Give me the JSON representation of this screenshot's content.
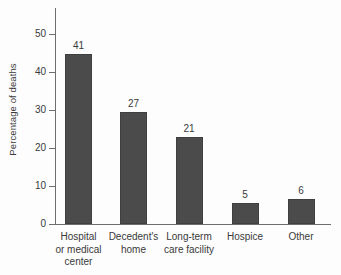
{
  "chart_data": {
    "type": "bar",
    "title": "",
    "xlabel": "",
    "ylabel": "Percentage of deaths",
    "categories": [
      "Hospital or medical center",
      "Decedent's home",
      "Long-term care facility",
      "Hospice",
      "Other"
    ],
    "category_lines": [
      [
        "Hospital",
        "or medical",
        "center"
      ],
      [
        "Decedent's",
        "home"
      ],
      [
        "Long-term",
        "care facility"
      ],
      [
        "Hospice"
      ],
      [
        "Other"
      ]
    ],
    "values": [
      41,
      27,
      21,
      5,
      6
    ],
    "value_labels": [
      "41",
      "27",
      "21",
      "5",
      "6"
    ],
    "ylim": [
      0,
      52
    ],
    "yticks": [
      0,
      10,
      20,
      30,
      40,
      50
    ],
    "ytick_labels": [
      "0",
      "10",
      "20",
      "30",
      "40",
      "50"
    ],
    "grid": false,
    "legend": null,
    "colors": {
      "bar": "#4b4b4b",
      "bar_border": "#3f3f3f",
      "axis": "#6d6d6d",
      "text": "#3a3a3a",
      "background": "#fdfdfd"
    }
  }
}
